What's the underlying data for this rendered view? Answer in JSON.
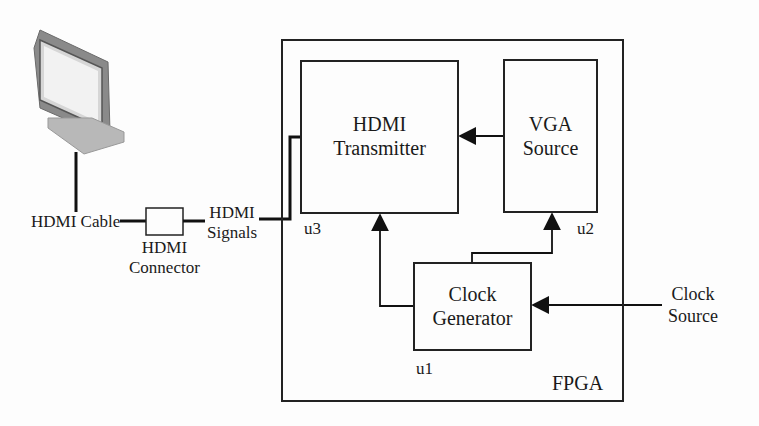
{
  "fpga": {
    "label": "FPGA"
  },
  "blocks": {
    "transmitter": {
      "line1": "HDMI",
      "line2": "Transmitter",
      "id": "u3"
    },
    "vga": {
      "line1": "VGA",
      "line2": "Source",
      "id": "u2"
    },
    "clock": {
      "line1": "Clock",
      "line2": "Generator",
      "id": "u1"
    }
  },
  "external": {
    "monitor": {
      "icon": "monitor-icon"
    },
    "cable": "HDMI Cable",
    "connector": {
      "line1": "HDMI",
      "line2": "Connector"
    },
    "signals": {
      "line1": "HDMI",
      "line2": "Signals"
    },
    "clock_source": {
      "line1": "Clock",
      "line2": "Source"
    }
  },
  "colors": {
    "line": "#111111",
    "background": "#fdfdfd"
  }
}
